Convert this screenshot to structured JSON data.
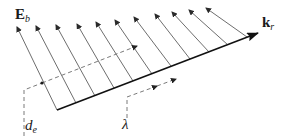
{
  "diagram": {
    "type": "wave-vector-field",
    "labels": {
      "field_vector": {
        "main": "E",
        "sub": "b"
      },
      "wave_vector": {
        "main": "k",
        "sub": "r"
      },
      "distance": {
        "main": "d",
        "sub": "e"
      },
      "wavelength": {
        "main": "λ"
      }
    },
    "colors": {
      "main_arrow": "#1a1a1a",
      "field_arrows": "#6e6e6e",
      "dashed_guides": "#7a7a7a",
      "text": "#1a1a1a"
    },
    "main_arrow": {
      "x1": 57,
      "y1": 110,
      "x2": 258,
      "y2": 33
    },
    "field_arrow_count": 11,
    "field_arrows": [
      {
        "x1": 57,
        "y1": 110,
        "x2": 17,
        "y2": 27
      },
      {
        "x1": 76,
        "y1": 103,
        "x2": 36,
        "y2": 26
      },
      {
        "x1": 95,
        "y1": 96,
        "x2": 56,
        "y2": 25
      },
      {
        "x1": 114,
        "y1": 88,
        "x2": 77,
        "y2": 24
      },
      {
        "x1": 133,
        "y1": 81,
        "x2": 96,
        "y2": 22
      },
      {
        "x1": 152,
        "y1": 74,
        "x2": 115,
        "y2": 20
      },
      {
        "x1": 171,
        "y1": 66,
        "x2": 134,
        "y2": 17
      },
      {
        "x1": 190,
        "y1": 59,
        "x2": 155,
        "y2": 14
      },
      {
        "x1": 209,
        "y1": 52,
        "x2": 172,
        "y2": 12
      },
      {
        "x1": 228,
        "y1": 45,
        "x2": 189,
        "y2": 10
      },
      {
        "x1": 247,
        "y1": 37,
        "x2": 206,
        "y2": 8
      }
    ],
    "dashed_de": {
      "points": [
        [
          24,
          136
        ],
        [
          24,
          90
        ],
        [
          42,
          83
        ],
        [
          137,
          46
        ]
      ],
      "dot": [
        42,
        83
      ]
    },
    "dashed_lambda": {
      "points": [
        [
          127,
          118
        ],
        [
          127,
          97
        ],
        [
          176,
          79
        ]
      ],
      "mid_arrow": [
        157,
        86
      ]
    }
  }
}
